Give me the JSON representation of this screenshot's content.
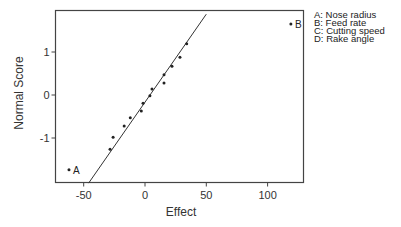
{
  "chart_data": {
    "type": "scatter",
    "title": "",
    "xlabel": "Effect",
    "ylabel": "Normal Score",
    "xlim": [
      -75,
      128
    ],
    "ylim": [
      -2.05,
      1.95
    ],
    "xticks": [
      -50,
      0,
      50,
      100
    ],
    "xtick_labels": [
      "-50",
      "0",
      "50",
      "100"
    ],
    "yticks": [
      -1,
      0,
      1
    ],
    "ytick_labels": [
      "-1",
      "0",
      "1"
    ],
    "grid": false,
    "legend_position": "right, outside plot",
    "series": [
      {
        "name": "Effects",
        "points": [
          {
            "x": -62,
            "y": -1.74,
            "label": "A"
          },
          {
            "x": -28.5,
            "y": -1.26
          },
          {
            "x": -26,
            "y": -0.98
          },
          {
            "x": -17,
            "y": -0.72
          },
          {
            "x": -12,
            "y": -0.53
          },
          {
            "x": -3,
            "y": -0.37
          },
          {
            "x": -1.6,
            "y": -0.19
          },
          {
            "x": 4,
            "y": -0.02
          },
          {
            "x": 5.7,
            "y": 0.14
          },
          {
            "x": 15.5,
            "y": 0.28
          },
          {
            "x": 15.5,
            "y": 0.47
          },
          {
            "x": 22,
            "y": 0.67
          },
          {
            "x": 28.5,
            "y": 0.88
          },
          {
            "x": 34,
            "y": 1.19
          },
          {
            "x": 119,
            "y": 1.65,
            "label": "B"
          }
        ]
      }
    ],
    "reference_line": {
      "x1": -46,
      "y1": -2.05,
      "x2": 50,
      "y2": 1.88
    },
    "annotations": [
      {
        "key": "A",
        "text": "A: Nose radius"
      },
      {
        "key": "B",
        "text": "B: Feed rate"
      },
      {
        "key": "C",
        "text": "C: Cutting speed"
      },
      {
        "key": "D",
        "text": "D: Rake angle"
      }
    ]
  },
  "labels": {
    "xlabel": "Effect",
    "ylabel": "Normal Score",
    "legend": [
      "A: Nose radius",
      "B: Feed rate",
      "C: Cutting speed",
      "D: Rake angle"
    ]
  }
}
